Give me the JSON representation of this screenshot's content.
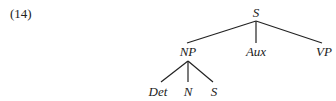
{
  "example_number": "(14)",
  "tree": {
    "root": "S",
    "level1": [
      "NP",
      "Aux",
      "VP"
    ],
    "level2_under_NP": [
      "Det",
      "N",
      "S"
    ]
  },
  "nodes": {
    "root": "S",
    "np": "NP",
    "aux": "Aux",
    "vp": "VP",
    "det": "Det",
    "n": "N",
    "s_embedded": "S"
  }
}
